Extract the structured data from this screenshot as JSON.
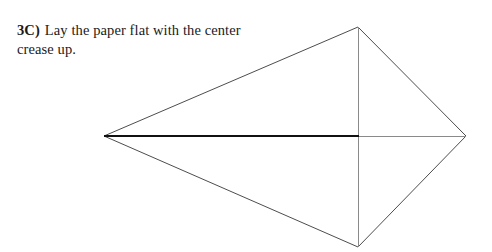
{
  "page": {
    "background_color": "#ffffff",
    "width": 492,
    "height": 252
  },
  "instruction": {
    "step_label": "3C)",
    "text": "Lay the paper flat with the center crease up.",
    "text_color": "#1a1a1a"
  },
  "diagram": {
    "name": "origami-kite-fold-diagram",
    "colors": {
      "outline": "#555555",
      "fold_line": "#8a8a8a",
      "crease_highlight": "#111111",
      "paper_fill": "#ffffff"
    },
    "vertices": {
      "left": {
        "x": 104,
        "y": 136
      },
      "top": {
        "x": 358,
        "y": 27
      },
      "right": {
        "x": 466,
        "y": 136
      },
      "bottom": {
        "x": 358,
        "y": 247
      }
    },
    "edges": [
      {
        "name": "upper-left-edge",
        "from": "left",
        "to": "top",
        "weight": 1
      },
      {
        "name": "upper-right-edge",
        "from": "top",
        "to": "right",
        "weight": 1
      },
      {
        "name": "lower-right-edge",
        "from": "right",
        "to": "bottom",
        "weight": 1
      },
      {
        "name": "lower-left-edge",
        "from": "bottom",
        "to": "left",
        "weight": 1
      }
    ],
    "fold_lines": [
      {
        "name": "vertical-fold-line",
        "from": {
          "x": 358,
          "y": 27
        },
        "to": {
          "x": 358,
          "y": 247
        },
        "weight": 1,
        "style": "thin"
      },
      {
        "name": "horizontal-thin-line",
        "from": {
          "x": 358,
          "y": 136
        },
        "to": {
          "x": 466,
          "y": 136
        },
        "weight": 1,
        "style": "thin"
      },
      {
        "name": "center-crease-highlight",
        "from": {
          "x": 104,
          "y": 136
        },
        "to": {
          "x": 358,
          "y": 136
        },
        "weight": 2.4,
        "style": "thick"
      }
    ]
  }
}
